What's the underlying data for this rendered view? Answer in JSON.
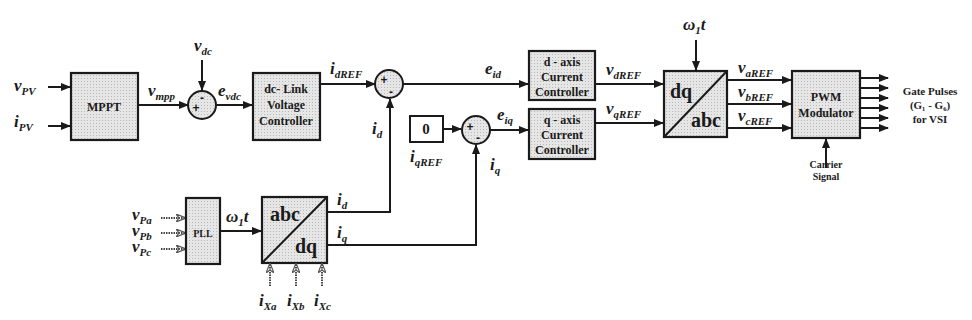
{
  "diagram": {
    "type": "control-block-diagram",
    "blocks": {
      "mppt": {
        "label": "MPPT"
      },
      "dc_link": {
        "line1": "dc- Link",
        "line2": "Voltage",
        "line3": "Controller"
      },
      "d_axis": {
        "line1": "d - axis",
        "line2": "Current",
        "line3": "Controller"
      },
      "q_axis": {
        "line1": "q - axis",
        "line2": "Current",
        "line3": "Controller"
      },
      "zero": {
        "label": "0"
      },
      "dq_abc": {
        "top": "dq",
        "bottom": "abc"
      },
      "abc_dq": {
        "top": "abc",
        "bottom": "dq"
      },
      "pll": {
        "label": "PLL"
      },
      "pwm": {
        "line1": "PWM",
        "line2": "Modulator"
      }
    },
    "signals": {
      "v_pv": {
        "main": "v",
        "sub": "PV"
      },
      "i_pv": {
        "main": "i",
        "sub": "PV"
      },
      "v_mpp": {
        "main": "v",
        "sub": "mpp"
      },
      "v_dc": {
        "main": "v",
        "sub": "dc"
      },
      "e_vdc": {
        "main": "e",
        "sub": "vdc"
      },
      "i_dref": {
        "main": "i",
        "sub": "dREF"
      },
      "i_d_fb": {
        "main": "i",
        "sub": "d"
      },
      "e_id": {
        "main": "e",
        "sub": "id"
      },
      "e_iq": {
        "main": "e",
        "sub": "iq"
      },
      "i_qref": {
        "main": "i",
        "sub": "qREF"
      },
      "i_q_fb": {
        "main": "i",
        "sub": "q"
      },
      "v_dref": {
        "main": "v",
        "sub": "dREF"
      },
      "v_qref": {
        "main": "v",
        "sub": "qREF"
      },
      "omega_top": {
        "main": "ω",
        "sub": "1",
        "tail": "t"
      },
      "v_aref": {
        "main": "v",
        "sub": "aREF"
      },
      "v_bref": {
        "main": "v",
        "sub": "bREF"
      },
      "v_cref": {
        "main": "v",
        "sub": "cREF"
      },
      "v_pa": {
        "main": "v",
        "sub": "Pa"
      },
      "v_pb": {
        "main": "v",
        "sub": "Pb"
      },
      "v_pc": {
        "main": "v",
        "sub": "Pc"
      },
      "omega_pll": {
        "main": "ω",
        "sub": "1",
        "tail": "t"
      },
      "i_d_out": {
        "main": "i",
        "sub": "d"
      },
      "i_q_out": {
        "main": "i",
        "sub": "q"
      },
      "i_xa": {
        "main": "i",
        "sub": "Xa"
      },
      "i_xb": {
        "main": "i",
        "sub": "Xb"
      },
      "i_xc": {
        "main": "i",
        "sub": "Xc"
      }
    },
    "signs": {
      "plus": "+",
      "minus": "-"
    },
    "outputs": {
      "gate_line1": "Gate Pulses",
      "gate_line2": "(G₁ - G₆)",
      "gate_line3": "for VSI",
      "carrier_line1": "Carrier",
      "carrier_line2": "Signal"
    }
  }
}
